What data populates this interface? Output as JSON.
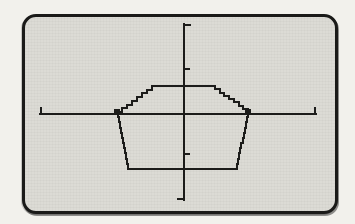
{
  "screen": {
    "left_px": 22,
    "top_px": 14,
    "width_px": 316,
    "height_px": 200,
    "corner_radius_px": 14,
    "border_px": 3,
    "fill_color": "#dcdbd5",
    "border_color": "#1a1a18",
    "page_background": "#f2f1ec"
  },
  "chart_data": {
    "type": "line",
    "title": "",
    "xlabel": "",
    "ylabel": "",
    "legend": "none",
    "grid": false,
    "axis_range_units": {
      "xlim": [
        -3.35,
        3.05
      ],
      "ylim": [
        -2.0,
        2.1
      ]
    },
    "y_tick_units": [
      1,
      -1
    ],
    "polygon_vertices_units": [
      [
        -0.75,
        0.65
      ],
      [
        0.6,
        0.65
      ],
      [
        1.5,
        0.0
      ],
      [
        1.2,
        -1.25
      ],
      [
        -1.3,
        -1.25
      ],
      [
        -1.55,
        0.0
      ]
    ],
    "pixel_geometry": {
      "x_axis": {
        "y": 114,
        "x1": 40,
        "x2": 316,
        "end_cap_up": 6
      },
      "y_axis": {
        "x": 184,
        "y1": 24,
        "y2": 200,
        "top_cap_right": 6,
        "bottom_cap_left": 6
      },
      "y_tick_y_px": [
        69,
        154
      ],
      "tick_len": 5,
      "polygon_vertices_px": [
        [
          152,
          86
        ],
        [
          210,
          86
        ],
        [
          248,
          112
        ],
        [
          236,
          169
        ],
        [
          128,
          169
        ],
        [
          117,
          112
        ]
      ],
      "vertex_markers_px": [
        [
          117,
          112
        ],
        [
          248,
          112
        ]
      ],
      "marker_size": 6,
      "stroke_width": 2.5,
      "step_len": 5
    },
    "colors": {
      "line": "#1c1c1a"
    }
  }
}
